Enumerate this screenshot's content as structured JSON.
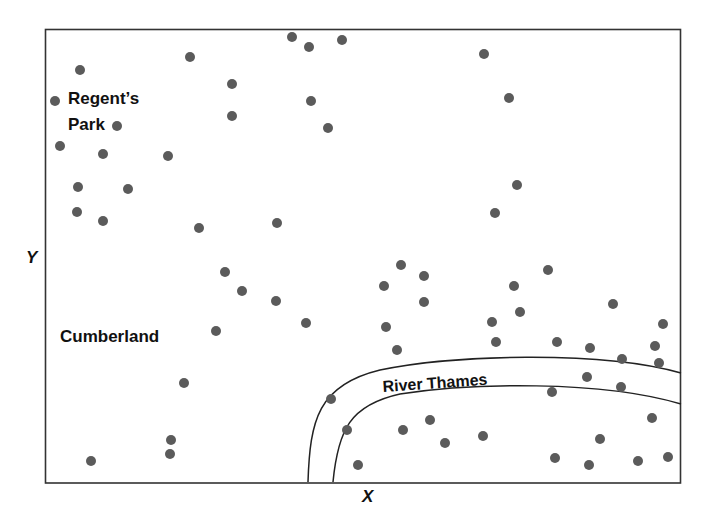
{
  "chart_data": {
    "type": "scatter",
    "title": "",
    "xlabel": "X",
    "ylabel": "Y",
    "grid": false,
    "legend": null,
    "plot_box_px": {
      "left": 45,
      "top": 29,
      "right": 681,
      "bottom": 483
    },
    "colors": {
      "point": "#5b5b5b",
      "frame": "#333333",
      "river": "#222222",
      "text": "#111111"
    },
    "annotations": [
      {
        "id": "regents-park",
        "lines": [
          "Regent’s",
          "Park"
        ],
        "x": 68,
        "y": 104
      },
      {
        "id": "cumberland",
        "lines": [
          "Cumberland"
        ],
        "x": 60,
        "y": 342
      },
      {
        "id": "river-thames",
        "lines": [
          "River Thames"
        ],
        "x": 383,
        "y": 392,
        "rotate": -4
      }
    ],
    "river": {
      "name": "River Thames",
      "upper_bank": "M 308 482 C 310 420, 318 385, 380 370 C 450 355, 600 350, 681 373",
      "lower_bank": "M 333 482 C 338 430, 350 405, 400 394 C 470 383, 600 380, 681 404"
    },
    "points": [
      [
        80,
        70
      ],
      [
        55,
        101
      ],
      [
        117,
        126
      ],
      [
        60,
        146
      ],
      [
        103,
        154
      ],
      [
        168,
        156
      ],
      [
        78,
        187
      ],
      [
        128,
        189
      ],
      [
        77,
        212
      ],
      [
        103,
        221
      ],
      [
        190,
        57
      ],
      [
        232,
        84
      ],
      [
        232,
        116
      ],
      [
        199,
        228
      ],
      [
        277,
        223
      ],
      [
        225,
        272
      ],
      [
        242,
        291
      ],
      [
        276,
        301
      ],
      [
        216,
        331
      ],
      [
        306,
        323
      ],
      [
        292,
        37
      ],
      [
        309,
        47
      ],
      [
        342,
        40
      ],
      [
        311,
        101
      ],
      [
        328,
        128
      ],
      [
        484,
        54
      ],
      [
        509,
        98
      ],
      [
        517,
        185
      ],
      [
        495,
        213
      ],
      [
        401,
        265
      ],
      [
        424,
        276
      ],
      [
        384,
        286
      ],
      [
        424,
        302
      ],
      [
        386,
        327
      ],
      [
        397,
        350
      ],
      [
        548,
        270
      ],
      [
        514,
        286
      ],
      [
        520,
        312
      ],
      [
        492,
        322
      ],
      [
        613,
        304
      ],
      [
        496,
        342
      ],
      [
        557,
        342
      ],
      [
        590,
        348
      ],
      [
        663,
        324
      ],
      [
        655,
        346
      ],
      [
        622,
        359
      ],
      [
        659,
        363
      ],
      [
        587,
        377
      ],
      [
        621,
        387
      ],
      [
        552,
        392
      ],
      [
        184,
        383
      ],
      [
        171,
        440
      ],
      [
        170,
        454
      ],
      [
        91,
        461
      ],
      [
        331,
        399
      ],
      [
        347,
        430
      ],
      [
        358,
        465
      ],
      [
        403,
        430
      ],
      [
        430,
        420
      ],
      [
        445,
        443
      ],
      [
        483,
        436
      ],
      [
        652,
        418
      ],
      [
        600,
        439
      ],
      [
        555,
        458
      ],
      [
        589,
        465
      ],
      [
        638,
        461
      ],
      [
        668,
        457
      ]
    ]
  },
  "labels": {
    "regents_line1": "Regent’s",
    "regents_line2": "Park",
    "cumberland": "Cumberland",
    "river": "River Thames",
    "x_axis": "X",
    "y_axis": "Y"
  }
}
